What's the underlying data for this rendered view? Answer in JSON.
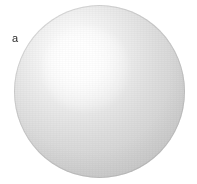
{
  "figure": {
    "panel_label": "a",
    "background_color": "#ffffff",
    "width_px": 197,
    "height_px": 184
  },
  "object": {
    "name": "sphere",
    "shape": "sphere",
    "description": "Smooth light-gray shaded sphere filling the panel",
    "center_x_px": 99,
    "center_y_px": 91,
    "diameter_x_px": 171,
    "diameter_y_px": 173,
    "bounds": {
      "left_px": 14,
      "top_px": 5,
      "right_px": 185,
      "bottom_px": 178
    },
    "highlight": {
      "name": "specular-highlight",
      "center_x_pct": 36,
      "center_y_pct": 29,
      "color": "#ffffff"
    },
    "colors": {
      "highlight": "#ffffff",
      "midtone": "#e2e2e2",
      "rim": "#c6c6c6",
      "terminator": "#bcbcbc",
      "outline": "#969696"
    }
  }
}
